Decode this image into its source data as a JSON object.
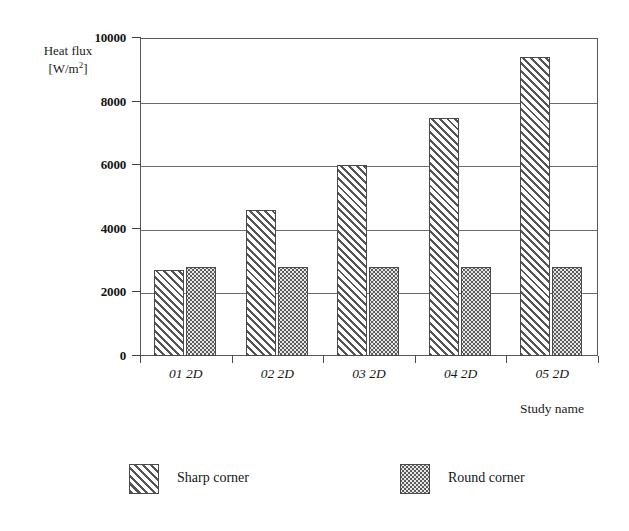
{
  "chart_data": {
    "type": "bar",
    "title": "",
    "ylabel_line1": "Heat flux",
    "ylabel_line2_prefix": "[W/m",
    "ylabel_line2_sup": "2",
    "ylabel_line2_suffix": "]",
    "xlabel": "Study name",
    "categories": [
      "01 2D",
      "02 2D",
      "03 2D",
      "04 2D",
      "05 2D"
    ],
    "series": [
      {
        "name": "Sharp corner",
        "values": [
          2700,
          4600,
          6000,
          7500,
          9400
        ],
        "pattern": "diagonal-hatch"
      },
      {
        "name": "Round corner",
        "values": [
          2800,
          2800,
          2800,
          2800,
          2800
        ],
        "pattern": "dotted"
      }
    ],
    "ylim": [
      0,
      10000
    ],
    "yticks": [
      0,
      2000,
      4000,
      6000,
      8000,
      10000
    ],
    "ytick_labels": [
      "0",
      "2000",
      "4000",
      "6000",
      "8000",
      "10000"
    ],
    "grid": true,
    "grid_axis": "y",
    "legend_position": "bottom",
    "colors": {
      "axis": "#585858",
      "grid": "#6a6a6a",
      "sharp_fill": "#ffffff",
      "sharp_hatch": "#555555",
      "round_fill": "#e6e6e6",
      "round_dots": "#5c5c5c",
      "background": "#ffffff",
      "text": "#1a1a1a"
    }
  }
}
